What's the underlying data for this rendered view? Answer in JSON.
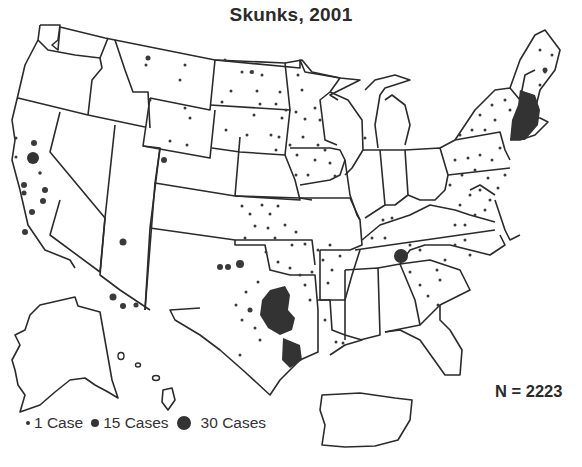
{
  "title": "Skunks, 2001",
  "total": "N = 2223",
  "legend": {
    "items": [
      {
        "label": "1 Case",
        "size": "small"
      },
      {
        "label": "15 Cases",
        "size": "medium"
      },
      {
        "label": "30 Cases",
        "size": "large"
      }
    ]
  },
  "map": {
    "region": "United States (with Alaska, Hawaii, Puerto Rico insets)",
    "subject": "Reported rabid skunks",
    "year": "2001",
    "symbol": "proportional dots",
    "dot_color": "#333333",
    "dense_regions": [
      "Central Texas",
      "Northeast (Massachusetts/Connecticut/Rhode Island)",
      "Central Tennessee",
      "Mid-Atlantic (Virginia/Maryland/Pennsylvania)",
      "Northern Plains (Dakotas, Minnesota, Iowa)",
      "Kansas / Oklahoma",
      "California coast"
    ]
  }
}
